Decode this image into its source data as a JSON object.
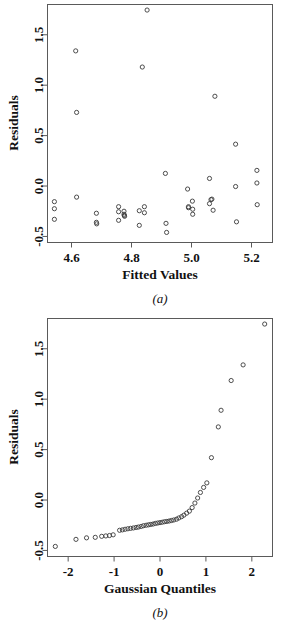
{
  "figure": {
    "panels": [
      {
        "id": "a",
        "panel_label": "(a)",
        "ylabel": "Residuals",
        "xlabel": "Fitted Values"
      },
      {
        "id": "b",
        "panel_label": "(b)",
        "ylabel": "Residuals",
        "xlabel": "Gaussian Quantiles"
      }
    ]
  },
  "chart_data": [
    {
      "type": "scatter",
      "title": "(a)",
      "xlabel": "Fitted Values",
      "ylabel": "Residuals",
      "xlim": [
        4.52,
        5.27
      ],
      "ylim": [
        -0.56,
        1.8
      ],
      "xticks": [
        4.6,
        4.8,
        5.0,
        5.2
      ],
      "xticklabels": [
        "4.6",
        "4.8",
        "5.0",
        "5.2"
      ],
      "yticks": [
        -0.5,
        0.0,
        0.5,
        1.0,
        1.5
      ],
      "yticklabels": [
        "-0.5",
        "0.0",
        "0.5",
        "1.0",
        "1.5"
      ],
      "grid": false,
      "legend": false,
      "marker": "open-circle",
      "points": [
        [
          4.543,
          -0.155
        ],
        [
          4.543,
          -0.225
        ],
        [
          4.543,
          -0.33
        ],
        [
          4.614,
          1.34
        ],
        [
          4.617,
          0.73
        ],
        [
          4.617,
          -0.11
        ],
        [
          4.683,
          -0.27
        ],
        [
          4.683,
          -0.36
        ],
        [
          4.684,
          -0.375
        ],
        [
          4.757,
          -0.205
        ],
        [
          4.757,
          -0.255
        ],
        [
          4.757,
          -0.34
        ],
        [
          4.775,
          -0.25
        ],
        [
          4.775,
          -0.28
        ],
        [
          4.776,
          -0.292
        ],
        [
          4.777,
          -0.3
        ],
        [
          4.826,
          -0.245
        ],
        [
          4.826,
          -0.39
        ],
        [
          4.836,
          1.18
        ],
        [
          4.843,
          -0.205
        ],
        [
          4.843,
          -0.265
        ],
        [
          4.852,
          1.745
        ],
        [
          4.913,
          0.125
        ],
        [
          4.915,
          -0.37
        ],
        [
          4.917,
          -0.46
        ],
        [
          4.987,
          -0.03
        ],
        [
          4.99,
          -0.205
        ],
        [
          4.99,
          -0.215
        ],
        [
          5.003,
          -0.15
        ],
        [
          5.004,
          -0.23
        ],
        [
          5.004,
          -0.28
        ],
        [
          5.06,
          0.075
        ],
        [
          5.06,
          -0.175
        ],
        [
          5.065,
          -0.135
        ],
        [
          5.068,
          -0.13
        ],
        [
          5.072,
          -0.24
        ],
        [
          5.078,
          0.89
        ],
        [
          5.147,
          0.415
        ],
        [
          5.147,
          -0.005
        ],
        [
          5.15,
          -0.355
        ],
        [
          5.218,
          0.155
        ],
        [
          5.218,
          0.03
        ],
        [
          5.219,
          -0.185
        ]
      ]
    },
    {
      "type": "scatter",
      "title": "(b)",
      "xlabel": "Gaussian Quantiles",
      "ylabel": "Residuals",
      "xlim": [
        -2.45,
        2.45
      ],
      "ylim": [
        -0.56,
        1.8
      ],
      "xticks": [
        -2,
        -1,
        0,
        1,
        2
      ],
      "xticklabels": [
        "-2",
        "-1",
        "0",
        "1",
        "2"
      ],
      "yticks": [
        -0.5,
        0.0,
        0.5,
        1.0,
        1.5
      ],
      "yticklabels": [
        "-0.5",
        "0.0",
        "0.5",
        "1.0",
        "1.5"
      ],
      "grid": false,
      "legend": false,
      "marker": "open-circle",
      "points": [
        [
          -2.28,
          -0.46
        ],
        [
          -1.83,
          -0.39
        ],
        [
          -1.6,
          -0.375
        ],
        [
          -1.41,
          -0.37
        ],
        [
          -1.27,
          -0.36
        ],
        [
          -1.18,
          -0.356
        ],
        [
          -1.1,
          -0.352
        ],
        [
          -1.02,
          -0.345
        ],
        [
          -0.88,
          -0.3
        ],
        [
          -0.82,
          -0.296
        ],
        [
          -0.76,
          -0.29
        ],
        [
          -0.7,
          -0.285
        ],
        [
          -0.64,
          -0.281
        ],
        [
          -0.58,
          -0.277
        ],
        [
          -0.52,
          -0.272
        ],
        [
          -0.47,
          -0.268
        ],
        [
          -0.41,
          -0.262
        ],
        [
          -0.36,
          -0.255
        ],
        [
          -0.3,
          -0.25
        ],
        [
          -0.25,
          -0.246
        ],
        [
          -0.2,
          -0.242
        ],
        [
          -0.15,
          -0.238
        ],
        [
          -0.1,
          -0.232
        ],
        [
          -0.05,
          -0.228
        ],
        [
          0.0,
          -0.224
        ],
        [
          0.05,
          -0.22
        ],
        [
          0.1,
          -0.215
        ],
        [
          0.15,
          -0.212
        ],
        [
          0.2,
          -0.208
        ],
        [
          0.25,
          -0.203
        ],
        [
          0.3,
          -0.198
        ],
        [
          0.36,
          -0.19
        ],
        [
          0.41,
          -0.178
        ],
        [
          0.47,
          -0.165
        ],
        [
          0.52,
          -0.15
        ],
        [
          0.58,
          -0.13
        ],
        [
          0.64,
          -0.11
        ],
        [
          0.7,
          -0.075
        ],
        [
          0.76,
          -0.03
        ],
        [
          0.82,
          0.02
        ],
        [
          0.88,
          0.075
        ],
        [
          0.95,
          0.125
        ],
        [
          1.02,
          0.17
        ],
        [
          1.12,
          0.42
        ],
        [
          1.27,
          0.725
        ],
        [
          1.33,
          0.89
        ],
        [
          1.55,
          1.185
        ],
        [
          1.81,
          1.34
        ],
        [
          2.28,
          1.745
        ]
      ]
    }
  ]
}
